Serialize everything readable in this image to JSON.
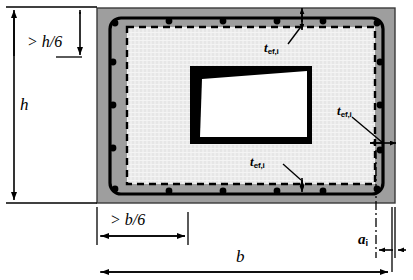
{
  "figure": {
    "type": "engineering-cross-section",
    "colors": {
      "concrete_cover": "#9e9e9e",
      "core_hatch": "#ededed",
      "stirrup": "#000000",
      "rebar": "#000000",
      "dashed_line": "#000000",
      "hole_fill": "#ffffff",
      "hole_border": "#000000",
      "dimension_line": "#000000",
      "background": "#ffffff"
    }
  },
  "labels": {
    "height_sixth": {
      "text": "> h/6",
      "var": "h",
      "expr": "> h/6"
    },
    "height": {
      "text": "h"
    },
    "width_sixth": {
      "text": "> b/6",
      "var": "b",
      "expr": "> b/6"
    },
    "width": {
      "text": "b"
    },
    "thickness_top": {
      "base": "t",
      "sub": "ef,i",
      "full": "t ef,i"
    },
    "thickness_right": {
      "base": "t",
      "sub": "ef,i",
      "full": "t ef,i"
    },
    "thickness_bottom": {
      "base": "t",
      "sub": "ef,i",
      "full": "t ef,i"
    },
    "edge_distance": {
      "base": "a",
      "sub": "i",
      "full": "a i"
    }
  },
  "dimensions": {
    "overall_height_label": "h",
    "overall_width_label": "b",
    "min_height_zone": "> h/6",
    "min_width_zone": "> b/6",
    "wall_thickness": "t_ef,i",
    "rebar_edge_distance": "a_i"
  },
  "reinforcement": {
    "top_bar_count": 6,
    "bottom_bar_count": 6,
    "left_bar_count": 4,
    "right_bar_count": 4
  }
}
